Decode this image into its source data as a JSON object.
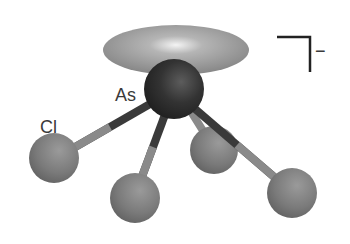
{
  "diagram": {
    "type": "molecular-structure",
    "central_atom": {
      "label": "As",
      "color": "#2e2e2e"
    },
    "ligand_label": "Cl",
    "ligand_color": "#7a7a7a",
    "lone_pair_color": "#8a8a8a",
    "charge": "−",
    "atoms": [
      {
        "id": "As",
        "cx": 174,
        "cy": 89,
        "r": 30
      },
      {
        "id": "Cl1",
        "cx": 54,
        "cy": 158,
        "r": 25
      },
      {
        "id": "Cl2",
        "cx": 135,
        "cy": 198,
        "r": 25
      },
      {
        "id": "Cl3",
        "cx": 214,
        "cy": 150,
        "r": 24
      },
      {
        "id": "Cl4",
        "cx": 292,
        "cy": 193,
        "r": 25
      }
    ]
  }
}
